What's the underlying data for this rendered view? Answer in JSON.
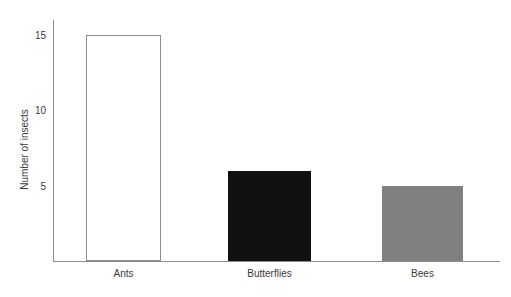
{
  "chart_data": {
    "type": "bar",
    "title": "",
    "xlabel": "",
    "ylabel": "Number of insects",
    "categories": [
      "Ants",
      "Butterflies",
      "Bees"
    ],
    "values": [
      15,
      6,
      5
    ],
    "ylim": [
      0,
      16
    ],
    "yticks": [
      5,
      10,
      15
    ],
    "ytick_labels": [
      "5",
      "10",
      "15"
    ],
    "grid": false,
    "legend": "none",
    "bar_styles": [
      {
        "category": "Ants",
        "fill": "#ffffff",
        "stroke": "#8e8e8e",
        "style": "outline"
      },
      {
        "category": "Butterflies",
        "fill": "#111111",
        "stroke": "#111111",
        "style": "solid"
      },
      {
        "category": "Bees",
        "fill": "#808080",
        "stroke": "#808080",
        "style": "solid"
      }
    ],
    "axis_color": "#8e8e8e",
    "text_color": "#3a3a3a",
    "background": "#ffffff"
  },
  "axes": {
    "y_title": "Number of insects",
    "tick_5": "5",
    "tick_10": "10",
    "tick_15": "15"
  },
  "categories": {
    "first": "Ants",
    "second": "Butterflies",
    "third": "Bees"
  },
  "title_sliver": ""
}
